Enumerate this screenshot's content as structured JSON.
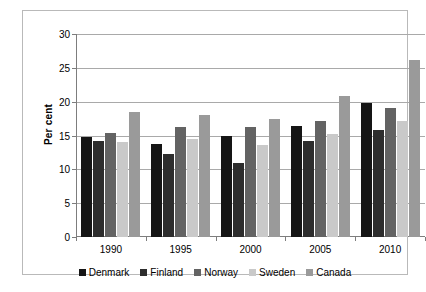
{
  "chart_data": {
    "type": "bar",
    "title": "",
    "xlabel": "",
    "ylabel": "Per cent",
    "categories": [
      "1990",
      "1995",
      "2000",
      "2005",
      "2010"
    ],
    "ylim": [
      0,
      30
    ],
    "yticks": [
      0,
      5,
      10,
      15,
      20,
      25,
      30
    ],
    "grid": true,
    "legend_position": "bottom",
    "series": [
      {
        "name": "Denmark",
        "color": "#151515",
        "values": [
          14.8,
          13.7,
          15.0,
          16.4,
          19.8
        ]
      },
      {
        "name": "Finland",
        "color": "#2d2d2d",
        "values": [
          14.2,
          12.2,
          11.0,
          14.2,
          15.8
        ]
      },
      {
        "name": "Norway",
        "color": "#636363",
        "values": [
          15.3,
          16.2,
          16.2,
          17.2,
          19.0
        ]
      },
      {
        "name": "Sweden",
        "color": "#c9c9c9",
        "values": [
          14.1,
          14.5,
          13.6,
          15.2,
          17.2
        ]
      },
      {
        "name": "Canada",
        "color": "#9a9a9a",
        "values": [
          18.5,
          18.0,
          17.5,
          20.8,
          26.1
        ]
      }
    ]
  },
  "axis": {
    "y_title": "Per cent"
  }
}
